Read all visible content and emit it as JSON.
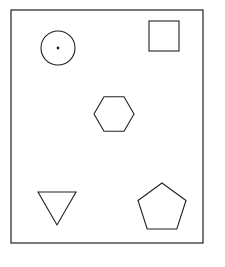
{
  "figure": {
    "title": "Geometric shapes inside a rectangular frame",
    "canvas": {
      "width": 225,
      "height": 267,
      "background_color": "#ffffff"
    },
    "stroke_color": "#231f20",
    "fill_color": "#ffffff",
    "frame": {
      "name": "bounding-rectangle",
      "x": 11,
      "y": 10,
      "width": 192,
      "height": 233,
      "stroke_width": 1.2
    },
    "shapes": [
      {
        "id": "circle",
        "label": "Circle with center dot",
        "type": "circle",
        "cx": 58,
        "cy": 48,
        "r": 17,
        "has_center_dot": true,
        "dot_r": 1.4,
        "position": "top-left"
      },
      {
        "id": "square",
        "label": "Square",
        "type": "rect",
        "x": 149,
        "y": 21,
        "width": 30,
        "height": 30,
        "position": "top-right"
      },
      {
        "id": "hexagon",
        "label": "Hexagon",
        "type": "polygon",
        "sides": 6,
        "cx": 114,
        "cy": 114,
        "r": 20,
        "orientation": "pointy-left-right",
        "points": "94,114 104,96.7 124,96.7 134,114 124,131.3 104,131.3",
        "position": "center"
      },
      {
        "id": "triangle",
        "label": "Downward triangle",
        "type": "polygon",
        "sides": 3,
        "orientation": "point-down",
        "points": "38,192 76,192 57,225",
        "position": "bottom-left"
      },
      {
        "id": "pentagon",
        "label": "Pentagon",
        "type": "polygon",
        "sides": 5,
        "cx": 162,
        "cy": 208,
        "r": 25,
        "orientation": "point-up",
        "points": "162,183 186,200.5 176.8,229 147.2,229 138,200.5",
        "position": "bottom-right"
      }
    ],
    "shape_count": 5
  }
}
